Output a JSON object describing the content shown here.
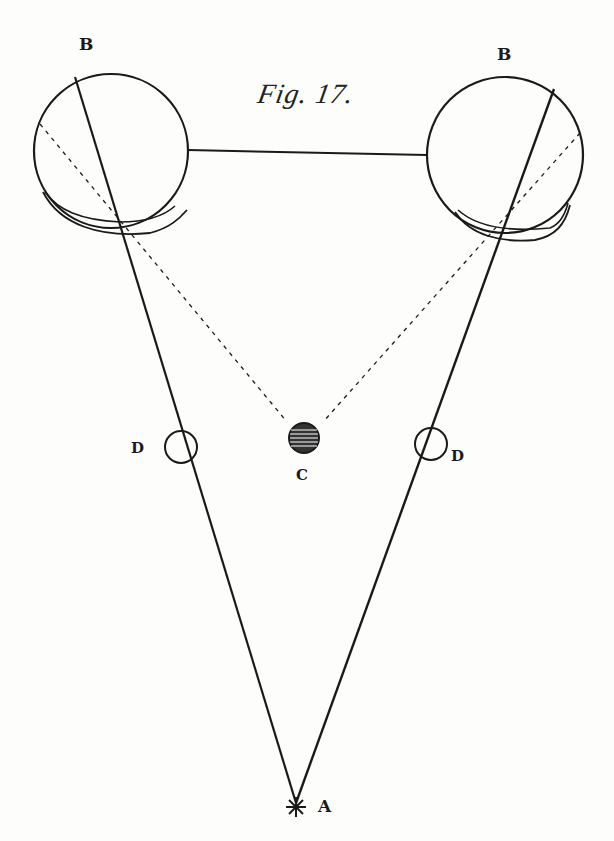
{
  "figure": {
    "caption": "Fig. 17.",
    "labels": {
      "eye_left": "B",
      "eye_right": "B",
      "object_center": "C",
      "ring_left": "D",
      "ring_right": "D",
      "point_source": "A"
    },
    "colors": {
      "ink": "#1a1a1a",
      "paper": "#fdfdfc"
    }
  }
}
